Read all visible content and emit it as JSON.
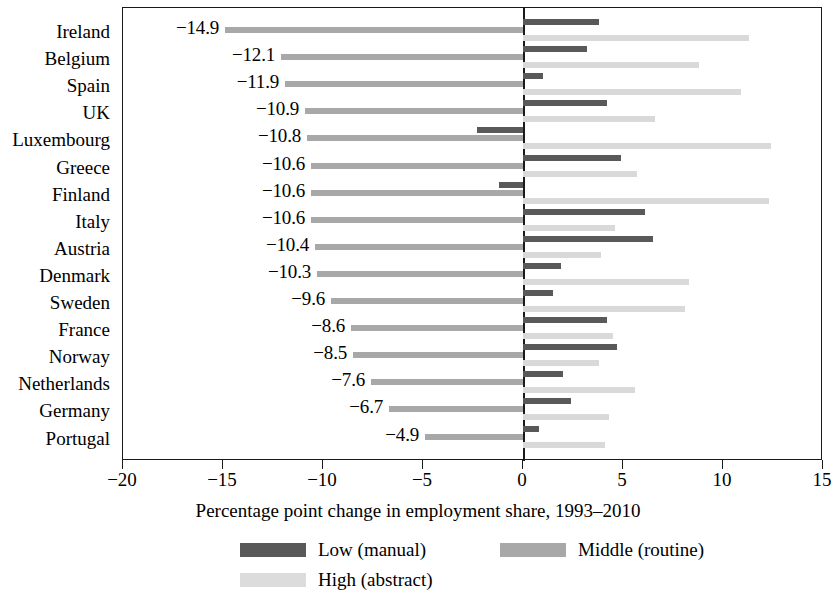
{
  "chart_data": {
    "type": "bar",
    "orientation": "horizontal",
    "title": "",
    "xlabel": "Percentage point change in employment share, 1993–2010",
    "ylabel": "",
    "xlim": [
      -20,
      15
    ],
    "xticks": [
      -20,
      -15,
      -10,
      -5,
      0,
      5,
      10,
      15
    ],
    "xticklabels": [
      "−20",
      "−15",
      "−10",
      "−5",
      "0",
      "5",
      "10",
      "15"
    ],
    "grid": false,
    "zero_line": true,
    "legend_position": "bottom",
    "categories": [
      "Ireland",
      "Belgium",
      "Spain",
      "UK",
      "Luxembourg",
      "Greece",
      "Finland",
      "Italy",
      "Austria",
      "Denmark",
      "Sweden",
      "France",
      "Norway",
      "Netherlands",
      "Germany",
      "Portugal"
    ],
    "series": [
      {
        "name": "Low (manual)",
        "color": "#595959",
        "values": [
          3.8,
          3.2,
          1.0,
          4.2,
          -2.3,
          4.9,
          -1.2,
          6.1,
          6.5,
          1.9,
          1.5,
          4.2,
          4.7,
          2.0,
          2.4,
          0.8
        ]
      },
      {
        "name": "Middle (routine)",
        "color": "#a8a8a8",
        "values": [
          -14.9,
          -12.1,
          -11.9,
          -10.9,
          -10.8,
          -10.6,
          -10.6,
          -10.6,
          -10.4,
          -10.3,
          -9.6,
          -8.6,
          -8.5,
          -7.6,
          -6.7,
          -4.9
        ]
      },
      {
        "name": "High (abstract)",
        "color": "#d9d9d9",
        "values": [
          11.3,
          8.8,
          10.9,
          6.6,
          12.4,
          5.7,
          12.3,
          4.6,
          3.9,
          8.3,
          8.1,
          4.5,
          3.8,
          5.6,
          4.3,
          4.1
        ]
      }
    ],
    "value_labels": [
      "−14.9",
      "−12.1",
      "−11.9",
      "−10.9",
      "−10.8",
      "−10.6",
      "−10.6",
      "−10.6",
      "−10.4",
      "−10.3",
      "−9.6",
      "−8.6",
      "−8.5",
      "−7.6",
      "−6.7",
      "−4.9"
    ]
  },
  "legend": {
    "items": [
      {
        "label": "Low (manual)",
        "color": "#595959"
      },
      {
        "label": "Middle (routine)",
        "color": "#a8a8a8"
      },
      {
        "label": "High (abstract)",
        "color": "#dcdcdc"
      }
    ]
  }
}
